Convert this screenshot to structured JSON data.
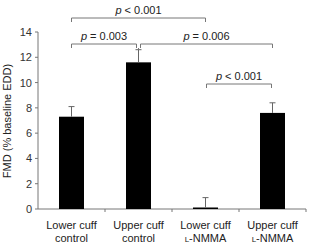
{
  "chart_data": {
    "type": "bar",
    "title": "",
    "xlabel": "",
    "ylabel": "FMD (% baseline EDD)",
    "ylim": [
      0,
      14
    ],
    "yticks": [
      0,
      2,
      4,
      6,
      8,
      10,
      12,
      14
    ],
    "grid": false,
    "legend": null,
    "categories": [
      [
        "Lower cuff",
        "control"
      ],
      [
        "Upper cuff",
        "control"
      ],
      [
        "Lower cuff",
        "l-NMMA"
      ],
      [
        "Upper cuff",
        "l-NMMA"
      ]
    ],
    "values": [
      7.3,
      11.6,
      0.1,
      7.6
    ],
    "error_upper": [
      8.1,
      12.6,
      0.9,
      8.4
    ],
    "bar_color": "#000000",
    "annotations": [
      {
        "text_italic": "p",
        "text": " < 0.001",
        "from": 0,
        "to": 2
      },
      {
        "text_italic": "p",
        "text": " = 0.003",
        "from": 0,
        "to": 1
      },
      {
        "text_italic": "p",
        "text": " = 0.006",
        "from": 1,
        "to": 3
      },
      {
        "text_italic": "p",
        "text": " < 0.001",
        "from": 2,
        "to": 3
      }
    ]
  }
}
